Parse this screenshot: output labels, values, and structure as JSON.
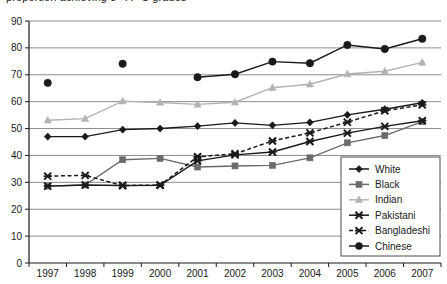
{
  "chart_data": {
    "type": "line",
    "title": "proportion achieving 5+ A*-C grades",
    "xlabel": "",
    "ylabel": "",
    "categories": [
      "1997",
      "1998",
      "1999",
      "2000",
      "2001",
      "2002",
      "2003",
      "2004",
      "2005",
      "2006",
      "2007"
    ],
    "x": [
      1997,
      1998,
      1999,
      2000,
      2001,
      2002,
      2003,
      2004,
      2005,
      2006,
      2007
    ],
    "ylim": [
      0,
      90
    ],
    "yticks": [
      0,
      10,
      20,
      30,
      40,
      50,
      60,
      70,
      80,
      90
    ],
    "grid": true,
    "legend_position": "bottom-right",
    "series": [
      {
        "name": "White",
        "marker": "diamond",
        "color": "#1a1a1a",
        "dash": false,
        "values": [
          47.0,
          47.0,
          49.6,
          50.0,
          50.9,
          52.1,
          51.2,
          52.3,
          55.1,
          57.2,
          59.6
        ]
      },
      {
        "name": "Black",
        "marker": "square",
        "color": "#6b6b6b",
        "dash": false,
        "values": [
          28.6,
          29.0,
          38.4,
          38.9,
          35.7,
          36.1,
          36.3,
          39.1,
          44.7,
          47.4,
          52.6
        ]
      },
      {
        "name": "Indian",
        "marker": "triangle",
        "color": "#b3b3b3",
        "dash": false,
        "values": [
          53.1,
          53.7,
          60.2,
          59.7,
          59.0,
          59.8,
          65.2,
          66.5,
          70.3,
          71.3,
          74.6
        ]
      },
      {
        "name": "Pakistani",
        "marker": "cross",
        "color": "#1a1a1a",
        "dash": false,
        "values": [
          28.6,
          29.0,
          28.8,
          28.9,
          38.0,
          40.2,
          41.3,
          45.2,
          48.3,
          50.8,
          52.9
        ]
      },
      {
        "name": "Bangladeshi",
        "marker": "cross",
        "color": "#1a1a1a",
        "dash": true,
        "values": [
          32.3,
          32.6,
          28.8,
          29.0,
          39.5,
          40.6,
          45.4,
          48.4,
          52.4,
          56.6,
          58.8
        ]
      },
      {
        "name": "Chinese",
        "marker": "circle",
        "color": "#1a1a1a",
        "dash": false,
        "values": [
          67.0,
          null,
          74.1,
          null,
          69.1,
          70.2,
          74.9,
          74.3,
          81.1,
          79.6,
          83.4
        ]
      }
    ]
  },
  "axis": {
    "y_tick_labels": [
      "90",
      "80",
      "70",
      "60",
      "50",
      "40",
      "30",
      "20",
      "10",
      "0"
    ],
    "x_tick_labels": [
      "1997",
      "1998",
      "1999",
      "2000",
      "2001",
      "2002",
      "2003",
      "2004",
      "2005",
      "2006",
      "2007"
    ]
  },
  "legend": {
    "items": [
      {
        "label": "White"
      },
      {
        "label": "Black"
      },
      {
        "label": "Indian"
      },
      {
        "label": "Pakistani"
      },
      {
        "label": "Bangladeshi"
      },
      {
        "label": "Chinese"
      }
    ]
  },
  "colors": {
    "white_series": "#1a1a1a",
    "black_series": "#6b6b6b",
    "indian_series": "#b3b3b3",
    "pakistani_series": "#1a1a1a",
    "bangladeshi_series": "#1a1a1a",
    "chinese_series": "#1a1a1a",
    "gridline": "#8c8c8c",
    "axis": "#1a1a1a",
    "background": "#ffffff"
  }
}
